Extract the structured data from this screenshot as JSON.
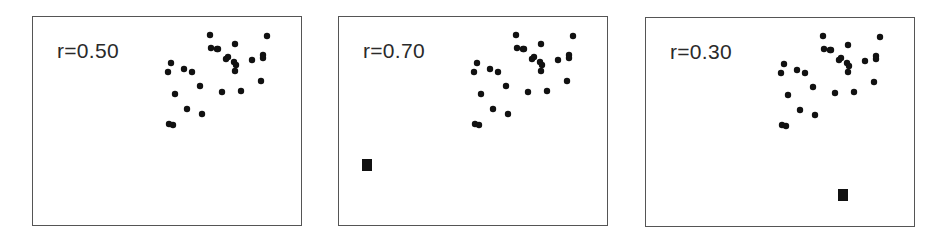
{
  "chart_data": [
    {
      "type": "scatter",
      "title": "",
      "annotation": "r=0.50",
      "xlabel": "",
      "ylabel": "",
      "grid": false,
      "legend": null,
      "points": [
        [
          177,
          18
        ],
        [
          178,
          31
        ],
        [
          184,
          32
        ],
        [
          234,
          19
        ],
        [
          202,
          27
        ],
        [
          185,
          32
        ],
        [
          193,
          42
        ],
        [
          195,
          40
        ],
        [
          201,
          45
        ],
        [
          203,
          48
        ],
        [
          202,
          54
        ],
        [
          219,
          43
        ],
        [
          230,
          38
        ],
        [
          230,
          41
        ],
        [
          228,
          64
        ],
        [
          189,
          75
        ],
        [
          208,
          74
        ],
        [
          138,
          46
        ],
        [
          135,
          55
        ],
        [
          151,
          52
        ],
        [
          159,
          55
        ],
        [
          142,
          77
        ],
        [
          167,
          69
        ],
        [
          154,
          92
        ],
        [
          169,
          97
        ],
        [
          136,
          107
        ],
        [
          140,
          108
        ]
      ],
      "outlier": null
    },
    {
      "type": "scatter",
      "title": "",
      "annotation": "r=0.70",
      "xlabel": "",
      "ylabel": "",
      "grid": false,
      "legend": null,
      "points": "same as panel 1",
      "outlier": {
        "x": 28,
        "y": 148,
        "marker": "square"
      }
    },
    {
      "type": "scatter",
      "title": "",
      "annotation": "r=0.30",
      "xlabel": "",
      "ylabel": "",
      "grid": false,
      "legend": null,
      "points": "same as panel 1",
      "outlier": {
        "x": 196,
        "y": 177,
        "marker": "square"
      }
    }
  ],
  "panels": [
    {
      "label": "r=0.50",
      "left": 32,
      "top": 16,
      "outlier": null
    },
    {
      "label": "r=0.70",
      "left": 338,
      "top": 16,
      "outlier": {
        "x": 23,
        "y": 142,
        "w": 10,
        "h": 12
      }
    },
    {
      "label": "r=0.30",
      "left": 645,
      "top": 17,
      "outlier": {
        "x": 192,
        "y": 171,
        "w": 10,
        "h": 12
      }
    }
  ],
  "points": [
    [
      177,
      18
    ],
    [
      178,
      31
    ],
    [
      184,
      32
    ],
    [
      234,
      19
    ],
    [
      202,
      27
    ],
    [
      185,
      32
    ],
    [
      193,
      42
    ],
    [
      195,
      40
    ],
    [
      201,
      45
    ],
    [
      203,
      48
    ],
    [
      202,
      54
    ],
    [
      219,
      43
    ],
    [
      230,
      38
    ],
    [
      230,
      41
    ],
    [
      228,
      64
    ],
    [
      189,
      75
    ],
    [
      208,
      74
    ],
    [
      138,
      46
    ],
    [
      135,
      55
    ],
    [
      151,
      52
    ],
    [
      159,
      55
    ],
    [
      142,
      77
    ],
    [
      167,
      69
    ],
    [
      154,
      92
    ],
    [
      169,
      97
    ],
    [
      136,
      107
    ],
    [
      140,
      108
    ]
  ],
  "colors": {
    "point": "#111111",
    "frame": "#555555",
    "text": "#2a2a2a"
  }
}
